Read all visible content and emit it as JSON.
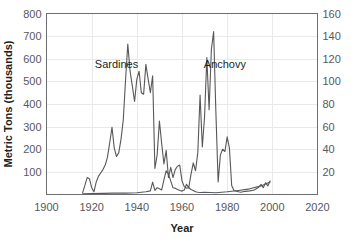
{
  "chart_data": {
    "type": "line",
    "title": "",
    "xlabel": "Year",
    "ylabel": "Metric Tons (thousands)",
    "ylabel_right": "",
    "xlim": [
      1900,
      2020
    ],
    "ylim": [
      0,
      800
    ],
    "ylim_right": [
      0,
      160
    ],
    "grid": true,
    "legend_position": "inline-annotations",
    "xticks": [
      1900,
      1920,
      1940,
      1960,
      1980,
      2000,
      2020
    ],
    "xtick_labels": [
      "1900",
      "1920",
      "1940",
      "1960",
      "1980",
      "2000",
      "2020"
    ],
    "yticks": [
      100,
      200,
      300,
      400,
      500,
      600,
      700,
      800
    ],
    "ytick_labels": [
      "100",
      "200",
      "300",
      "400",
      "500",
      "600",
      "700",
      "800"
    ],
    "yticks_right": [
      20,
      40,
      60,
      80,
      100,
      120,
      140,
      160
    ],
    "ytick_labels_right": [
      "20",
      "40",
      "60",
      "80",
      "100",
      "120",
      "140",
      "160"
    ],
    "annotations": [
      {
        "text": "Sardines",
        "x": 1931,
        "y": 560
      },
      {
        "text": "Anchovy",
        "x": 1979,
        "y": 560
      }
    ],
    "series": [
      {
        "name": "Sardines",
        "axis": "left",
        "color": "#58585b",
        "x": [
          1916,
          1917,
          1918,
          1919,
          1920,
          1921,
          1922,
          1923,
          1924,
          1925,
          1926,
          1927,
          1928,
          1929,
          1930,
          1931,
          1932,
          1933,
          1934,
          1935,
          1936,
          1937,
          1938,
          1939,
          1940,
          1941,
          1942,
          1943,
          1944,
          1945,
          1946,
          1947,
          1948,
          1949,
          1950,
          1951,
          1952,
          1953,
          1954,
          1955,
          1956,
          1957,
          1958,
          1959,
          1960,
          1961,
          1962,
          1963,
          1964,
          1965,
          1966,
          1967,
          1968,
          1970,
          1975,
          1980,
          1985,
          1990,
          1995,
          1999
        ],
        "values": [
          8,
          40,
          75,
          70,
          30,
          12,
          55,
          80,
          95,
          110,
          130,
          165,
          230,
          297,
          205,
          168,
          185,
          245,
          330,
          505,
          665,
          545,
          480,
          411,
          510,
          545,
          450,
          443,
          575,
          510,
          450,
          525,
          115,
          175,
          325,
          225,
          135,
          195,
          75,
          120,
          75,
          110,
          125,
          130,
          60,
          35,
          28,
          30,
          22,
          18,
          12,
          10,
          9,
          10,
          8,
          12,
          18,
          25,
          38,
          55
        ]
      },
      {
        "name": "Anchovy",
        "axis": "left",
        "color": "#58585b",
        "x": [
          1916,
          1920,
          1925,
          1930,
          1935,
          1940,
          1942,
          1944,
          1946,
          1947,
          1948,
          1949,
          1950,
          1951,
          1952,
          1953,
          1954,
          1955,
          1956,
          1957,
          1958,
          1959,
          1960,
          1961,
          1962,
          1963,
          1964,
          1965,
          1966,
          1967,
          1968,
          1969,
          1970,
          1971,
          1972,
          1973,
          1974,
          1975,
          1976,
          1977,
          1978,
          1979,
          1980,
          1981,
          1982,
          1983,
          1984,
          1985,
          1986,
          1988,
          1990,
          1992,
          1994,
          1995,
          1996,
          1997,
          1998,
          1999
        ],
        "values": [
          3,
          4,
          5,
          6,
          6,
          8,
          10,
          12,
          16,
          55,
          18,
          30,
          25,
          20,
          65,
          105,
          90,
          60,
          30,
          28,
          22,
          18,
          15,
          20,
          45,
          30,
          90,
          140,
          105,
          185,
          440,
          210,
          345,
          605,
          375,
          640,
          720,
          365,
          55,
          175,
          200,
          190,
          255,
          205,
          40,
          18,
          14,
          12,
          10,
          14,
          16,
          20,
          32,
          45,
          30,
          52,
          38,
          60
        ]
      }
    ]
  },
  "axes": {
    "left_title": "Metric Tons (thousands)",
    "bottom_title": "Year"
  }
}
